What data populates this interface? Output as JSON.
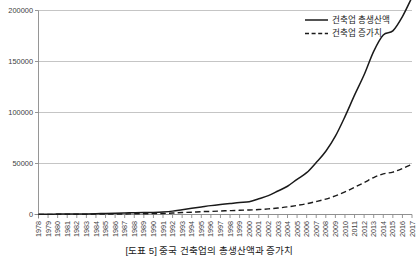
{
  "caption": "[도표 5] 중국 건축업의 총생산액과 증가치",
  "chart_data": {
    "type": "line",
    "title": "",
    "xlabel": "",
    "ylabel": "",
    "ylim": [
      0,
      200000
    ],
    "yticks": [
      0,
      50000,
      100000,
      150000,
      200000
    ],
    "ytick_labels": [
      "0",
      "50000",
      "100000",
      "150000",
      "200000"
    ],
    "grid": true,
    "legend_position": "top-right",
    "x": [
      1978,
      1979,
      1980,
      1981,
      1982,
      1983,
      1984,
      1985,
      1986,
      1987,
      1988,
      1989,
      1990,
      1991,
      1992,
      1993,
      1994,
      1995,
      1996,
      1997,
      1998,
      1999,
      2000,
      2001,
      2002,
      2003,
      2004,
      2005,
      2006,
      2007,
      2008,
      2009,
      2010,
      2011,
      2012,
      2013,
      2014,
      2015,
      2016,
      2017
    ],
    "xtick_labels": [
      "1978",
      "1979",
      "1980",
      "1981",
      "1982",
      "1983",
      "1984",
      "1985",
      "1986",
      "1987",
      "1988",
      "1989",
      "1990",
      "1991",
      "1992",
      "1993",
      "1994",
      "1995",
      "1996",
      "1997",
      "1998",
      "1999",
      "2000",
      "2001",
      "2002",
      "2003",
      "2004",
      "2005",
      "2006",
      "2007",
      "2008",
      "2009",
      "2010",
      "2011",
      "2012",
      "2013",
      "2014",
      "2015",
      "2016",
      "2017"
    ],
    "series": [
      {
        "name": "건축업 총생산액",
        "style": "solid",
        "color": "#1a1a1a",
        "values": [
          280,
          320,
          390,
          430,
          510,
          600,
          760,
          1000,
          1200,
          1450,
          1750,
          1900,
          2080,
          2500,
          3300,
          4700,
          6100,
          7400,
          8700,
          9800,
          10800,
          11800,
          12500,
          15400,
          18500,
          23000,
          27700,
          34500,
          41000,
          51000,
          62000,
          76800,
          96000,
          117000,
          137000,
          160000,
          176000,
          180000,
          194000,
          213000
        ]
      },
      {
        "name": "건축업 증가치",
        "style": "dashed",
        "color": "#1a1a1a",
        "values": [
          139,
          148,
          195,
          207,
          240,
          270,
          320,
          417,
          488,
          553,
          670,
          724,
          860,
          1015,
          1415,
          1947,
          2271,
          2797,
          3014,
          3419,
          3807,
          4112,
          4450,
          4838,
          5470,
          6344,
          7463,
          8934,
          10572,
          12722,
          15110,
          18304,
          22234,
          26652,
          31273,
          36250,
          39862,
          41606,
          45086,
          49158
        ]
      }
    ],
    "legend": [
      "건축업 총생산액",
      "건축업 증가치"
    ]
  }
}
